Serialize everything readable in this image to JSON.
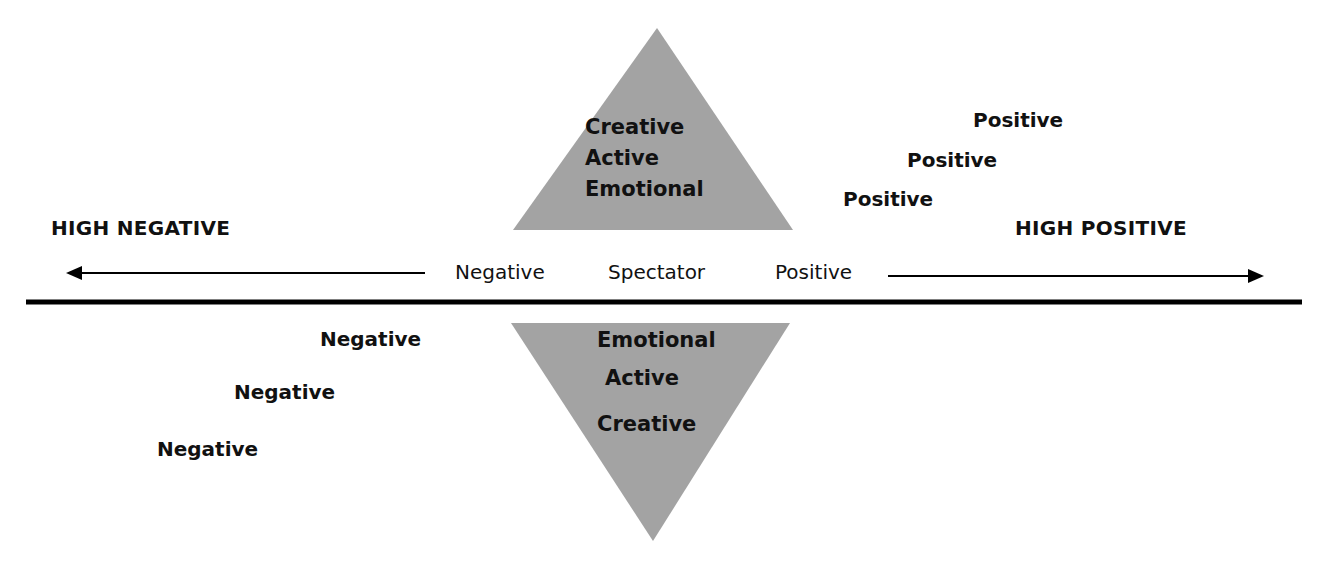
{
  "diagram": {
    "title": "",
    "colors": {
      "triangle_fill": "#a3a3a3",
      "line": "#000000",
      "text": "#111111"
    },
    "top_triangle": {
      "lines": [
        "Creative",
        "Active",
        "Emotional"
      ]
    },
    "bottom_triangle": {
      "lines": [
        "Emotional",
        "Active",
        "Creative"
      ]
    },
    "axis": {
      "left_end": "HIGH NEGATIVE",
      "right_end": "HIGH POSITIVE",
      "center_labels": [
        "Negative",
        "Spectator",
        "Positive"
      ]
    },
    "positive_steps": [
      "Positive",
      "Positive",
      "Positive"
    ],
    "negative_steps": [
      "Negative",
      "Negative",
      "Negative"
    ]
  }
}
